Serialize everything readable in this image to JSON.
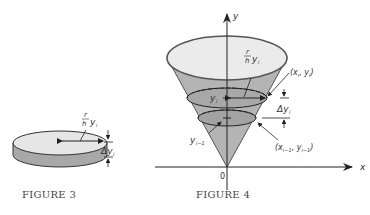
{
  "figure3": {
    "caption": "FIGURE 3",
    "radius_label_num": "r",
    "radius_label_den": "h",
    "radius_label_var": "y",
    "radius_label_sub": "i",
    "thickness_label": "Δy",
    "thickness_label_sub": "i",
    "colors": {
      "top": "#e6e6e6",
      "side": "#a8a8a8",
      "outline": "#333333"
    }
  },
  "figure4": {
    "caption": "FIGURE 4",
    "axis_y_label": "y",
    "axis_x_label": "x",
    "origin_label": "0",
    "radius_label_num": "r",
    "radius_label_den": "h",
    "radius_label_var": "y",
    "radius_label_sub": "i",
    "yi_label": "y",
    "yi_label_sub": "i",
    "yim1_label": "y",
    "yim1_label_sub": "i−1",
    "point_i_label": "(x",
    "point_i_sub1": "i",
    "point_i_mid": ", y",
    "point_i_sub2": "i",
    "point_i_end": ")",
    "point_im1_label": "(x",
    "point_im1_sub1": "i−1",
    "point_im1_mid": ", y",
    "point_im1_sub2": "i−1",
    "point_im1_end": ")",
    "delta_label": "Δy",
    "delta_label_sub": "i",
    "colors": {
      "cone_fill": "#b4b4b4",
      "top_fill": "#ebebeb",
      "slice_fill": "#a3a3a3",
      "outline": "#555555"
    }
  }
}
